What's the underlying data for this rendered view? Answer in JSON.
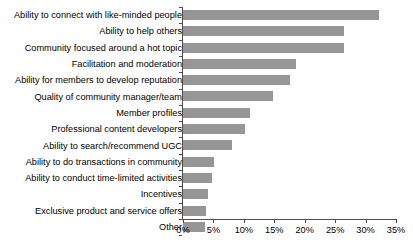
{
  "chart_data": {
    "type": "bar",
    "orientation": "horizontal",
    "title": "",
    "xlabel": "",
    "ylabel": "",
    "xlim": [
      0,
      35
    ],
    "xtick_labels": [
      "0%",
      "5%",
      "10%",
      "15%",
      "20%",
      "25%",
      "30%",
      "35%"
    ],
    "xtick_values": [
      0,
      5,
      10,
      15,
      20,
      25,
      30,
      35
    ],
    "grid": false,
    "legend": false,
    "bar_color": "#969696",
    "axis_color": "#4d4d4d",
    "categories": [
      "Ability to connect with like-minded people",
      "Ability to help others",
      "Community focused around a hot topic",
      "Facilitation and moderation",
      "Ability for members to develop reputation",
      "Quality of community manager/team",
      "Member profiles",
      "Professional content developers",
      "Ability to search/recommend UGC",
      "Ability to do transactions in community",
      "Ability to conduct time-limited activities",
      "Incentives",
      "Exclusive product and service offers",
      "Other"
    ],
    "values": [
      32.2,
      26.4,
      26.4,
      18.6,
      17.6,
      14.8,
      11.0,
      10.2,
      8.0,
      5.1,
      4.8,
      4.1,
      3.8,
      3.6
    ]
  }
}
